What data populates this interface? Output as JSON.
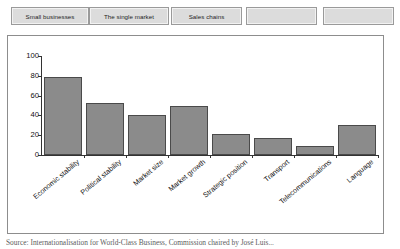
{
  "tab_bar": {
    "buttons": [
      {
        "label": "Small businesses",
        "left": 11,
        "width": 78
      },
      {
        "label": "The single market",
        "left": 89,
        "width": 80
      },
      {
        "label": "Sales chains",
        "left": 171,
        "width": 71
      },
      {
        "label": "",
        "left": 246,
        "width": 71
      },
      {
        "label": "",
        "left": 323,
        "width": 71
      }
    ]
  },
  "chart_data": {
    "type": "bar",
    "title": "",
    "xlabel": "",
    "ylabel": "",
    "ylim": [
      0,
      100
    ],
    "yticks": [
      0,
      20,
      40,
      60,
      80,
      100
    ],
    "grid": false,
    "legend": "none",
    "bar_color": "#8b8b8b",
    "bar_border_color": "#4a4a4a",
    "categories": [
      "Economic stability",
      "Political stability",
      "Market size",
      "Market growth",
      "Strategic position",
      "Transport",
      "Telecommunications",
      "Language"
    ],
    "values": [
      79,
      53,
      40,
      50,
      21,
      17,
      9,
      30
    ]
  },
  "caption": {
    "text": "Source: Internationalisation for World-Class Business, Commission chaired by José Luis..."
  }
}
